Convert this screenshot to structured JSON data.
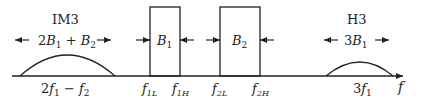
{
  "diagram": {
    "axis_label": "f",
    "im3": {
      "title": "IM3",
      "width_coef": "2",
      "b1": "B",
      "b1_sub": "1",
      "plus": " + ",
      "b2": "B",
      "b2_sub": "2",
      "center_a": "2",
      "f1": "f",
      "f1_sub": "1",
      "minus": " − ",
      "f2": "f",
      "f2_sub": "2"
    },
    "h3": {
      "title": "H3",
      "width_coef": "3",
      "b": "B",
      "b_sub": "1",
      "center_coef": "3",
      "f": "f",
      "f_sub": "1"
    },
    "band1": {
      "label": "B",
      "sub": "1",
      "low": "f",
      "low_sub": "1L",
      "high": "f",
      "high_sub": "1H"
    },
    "band2": {
      "label": "B",
      "sub": "2",
      "low": "f",
      "low_sub": "2L",
      "high": "f",
      "high_sub": "2H"
    },
    "colors": {
      "stroke": "#222222"
    }
  }
}
